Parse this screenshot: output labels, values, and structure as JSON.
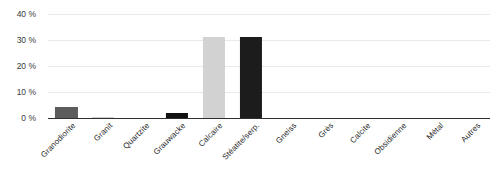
{
  "chart_data": {
    "type": "bar",
    "title": "",
    "subtitle": "",
    "xlabel": "",
    "ylabel": "",
    "ylim": [
      0,
      40
    ],
    "ytick_values": [
      40,
      30,
      20,
      10,
      0
    ],
    "ytick_labels": [
      "40 %",
      "30 %",
      "20 %",
      "10 %",
      "0 %"
    ],
    "grid": true,
    "legend": "none",
    "categories": [
      "Granodiorite",
      "Granit",
      "Quartzite",
      "Grauwacke",
      "Calcaire",
      "Stéatite/serp.",
      "Gneiss",
      "Grès",
      "Calcite",
      "Obsidienne",
      "Métal",
      "Autres"
    ],
    "values": [
      4.2,
      0.5,
      0,
      2.0,
      31.0,
      31.0,
      0,
      0,
      0,
      0,
      0,
      0
    ],
    "bar_colors": [
      "#5c5c5c",
      "#cfcfcf",
      "#9a9a9a",
      "#111111",
      "#d2d2d2",
      "#1c1c1c",
      "#9a9a9a",
      "#9a9a9a",
      "#9a9a9a",
      "#9a9a9a",
      "#9a9a9a",
      "#9a9a9a"
    ]
  },
  "style": {
    "background": "#ffffff",
    "grid_color": "#e9e9e9",
    "axis_color": "#2f2f2f",
    "text_color": "#1f1f1f"
  }
}
